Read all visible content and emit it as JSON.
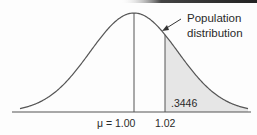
{
  "chart_data": {
    "type": "area",
    "title": "",
    "annotation": {
      "text_line1": "Population",
      "text_line2": "distribution"
    },
    "mean_label": "μ = 1.00",
    "mean": 1.0,
    "cutoff_label": "1.02",
    "cutoff": 1.02,
    "shaded_area_label": ".3446",
    "shaded_area": 0.3446,
    "xlabel": "",
    "ylabel": "",
    "grid": false,
    "legend": "none"
  },
  "colors": {
    "curve": "#555555",
    "shade": "#e6e6e6",
    "axis": "#555555",
    "text": "#2a2a2a"
  }
}
